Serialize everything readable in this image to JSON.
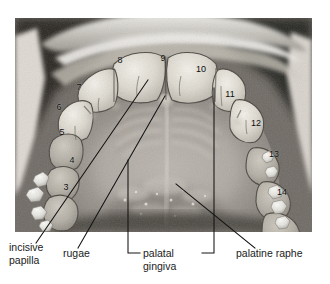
{
  "figure": {
    "kind": "intraoral-photograph",
    "photo": {
      "x": 15,
      "y": 18,
      "width": 297,
      "height": 214
    },
    "canvas": {
      "width": 330,
      "height": 284
    },
    "ink_color": "#141414",
    "label_color": "#1a1a1a",
    "number_color": "#0d0d0d",
    "background_color": "#ffffff"
  },
  "tooth_numbers": [
    {
      "label": "3",
      "x": 66,
      "y": 190
    },
    {
      "label": "4",
      "x": 72,
      "y": 163
    },
    {
      "label": "5",
      "x": 62,
      "y": 135
    },
    {
      "label": "6",
      "x": 59,
      "y": 110
    },
    {
      "label": "7",
      "x": 79,
      "y": 90
    },
    {
      "label": "8",
      "x": 120,
      "y": 63
    },
    {
      "label": "9",
      "x": 163,
      "y": 61
    },
    {
      "label": "10",
      "x": 201,
      "y": 72
    },
    {
      "label": "11",
      "x": 230,
      "y": 97
    },
    {
      "label": "12",
      "x": 256,
      "y": 126
    },
    {
      "label": "13",
      "x": 274,
      "y": 157
    },
    {
      "label": "14",
      "x": 282,
      "y": 195
    }
  ],
  "annotations": [
    {
      "name": "incisive-papilla",
      "lines": [
        "incisive",
        "papilla"
      ],
      "text_x": 9,
      "text_y": 251,
      "line_height": 13,
      "leader": {
        "x1": 36,
        "y1": 243,
        "x2": 148,
        "y2": 80
      }
    },
    {
      "name": "rugae",
      "lines": [
        "rugae"
      ],
      "text_x": 63,
      "text_y": 257,
      "line_height": 13,
      "leader": {
        "x1": 78,
        "y1": 248,
        "x2": 165,
        "y2": 96
      }
    },
    {
      "name": "palatal-gingiva",
      "lines": [
        "palatal",
        "gingiva"
      ],
      "text_x": 143,
      "text_y": 257,
      "line_height": 13,
      "bracket": {
        "left_x": 128,
        "right_x": 214,
        "base_y": 253,
        "left_top_y": 160,
        "right_top_y": 88,
        "stub": 12
      }
    },
    {
      "name": "palatine-raphe",
      "lines": [
        "palatine raphe"
      ],
      "text_x": 236,
      "text_y": 257,
      "line_height": 13,
      "leader": {
        "x1": 255,
        "y1": 248,
        "x2": 176,
        "y2": 184
      }
    }
  ]
}
